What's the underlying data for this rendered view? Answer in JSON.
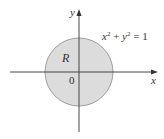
{
  "diagram": {
    "type": "region-plot",
    "x_axis_label": "x",
    "y_axis_label": "y",
    "origin_label": "0",
    "region_label": "R",
    "equation": {
      "lhs_x": "x",
      "exp1": "2",
      "plus": " + ",
      "lhs_y": "y",
      "exp2": "2",
      "rhs": " = 1"
    },
    "circle": {
      "center": [
        0,
        0
      ],
      "radius": 1,
      "fill": "#d9d9d9",
      "stroke": "#8a8a8a"
    },
    "axis_color": "#333333"
  }
}
